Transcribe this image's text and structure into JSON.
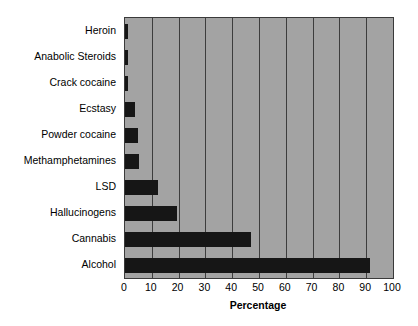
{
  "chart_data": {
    "type": "bar",
    "orientation": "horizontal",
    "title": "",
    "xlabel": "Percentage",
    "ylabel": "",
    "xlim": [
      0,
      100
    ],
    "xticks": [
      0,
      10,
      20,
      30,
      40,
      50,
      60,
      70,
      80,
      90,
      100
    ],
    "xtick_labels": [
      "0",
      "10",
      "20",
      "30",
      "40",
      "50",
      "60",
      "70",
      "80",
      "90",
      "100"
    ],
    "grid": "vertical",
    "legend": "none",
    "categories": [
      "Heroin",
      "Anabolic Steroids",
      "Crack cocaine",
      "Ecstasy",
      "Powder cocaine",
      "Methamphetamines",
      "LSD",
      "Hallucinogens",
      "Cannabis",
      "Alcohol"
    ],
    "values": [
      1,
      1,
      1,
      3.7,
      4.8,
      5.2,
      12.3,
      19.4,
      47,
      91.5
    ],
    "colors": {
      "bar": "#161616",
      "plot_background": "#a3a3a3",
      "gridline": "#3d3d3d",
      "axis_border": "#3a3a3a",
      "figure_background": "#ffffff",
      "text": "#000000"
    }
  }
}
